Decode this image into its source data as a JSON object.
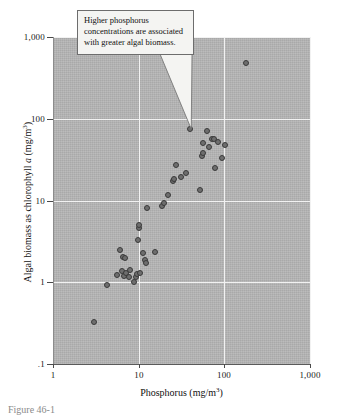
{
  "figure": {
    "caption_fragment": "Figure 46-1"
  },
  "callout": {
    "text": "Higher phosphorus concentrations are associated with greater algal biomass.",
    "target_point": {
      "x": 40,
      "y": 75
    }
  },
  "chart_data": {
    "type": "scatter",
    "title": "",
    "xlabel": "Phosphorus (mg/m",
    "xlabel_sup": "3",
    "xlabel_tail": ")",
    "ylabel_pre": "Algal biomass as chlorophyll ",
    "ylabel_ital": "a",
    "ylabel_mid": " (mg/m",
    "ylabel_sup": "3",
    "ylabel_tail": ")",
    "xscale": "log",
    "yscale": "log",
    "xlim": [
      1,
      1000
    ],
    "ylim": [
      0.1,
      1000
    ],
    "xticks": [
      1,
      10,
      100,
      1000
    ],
    "xtick_labels": [
      "1",
      "10",
      "100",
      "1,000"
    ],
    "yticks": [
      0.1,
      1,
      10,
      100,
      1000
    ],
    "ytick_labels": [
      ".1",
      "1",
      "10",
      "100",
      "1,000"
    ],
    "grid": true,
    "grid_color": "#f2f2f2",
    "plot_background": "#b5b5b5",
    "marker_fill": "#6e6e6e",
    "marker_edge": "#3a3a3a",
    "legend": "none",
    "points": [
      {
        "x": 3.0,
        "y": 0.33
      },
      {
        "x": 4.3,
        "y": 0.93
      },
      {
        "x": 5.6,
        "y": 1.22
      },
      {
        "x": 6.1,
        "y": 2.45
      },
      {
        "x": 6.3,
        "y": 1.38
      },
      {
        "x": 6.5,
        "y": 2.05
      },
      {
        "x": 6.8,
        "y": 1.18
      },
      {
        "x": 6.9,
        "y": 2.0
      },
      {
        "x": 7.2,
        "y": 1.3
      },
      {
        "x": 7.6,
        "y": 1.15
      },
      {
        "x": 8.0,
        "y": 1.42
      },
      {
        "x": 8.7,
        "y": 1.02
      },
      {
        "x": 9.2,
        "y": 1.15
      },
      {
        "x": 9.6,
        "y": 1.28
      },
      {
        "x": 9.7,
        "y": 3.3
      },
      {
        "x": 10.0,
        "y": 4.6
      },
      {
        "x": 10.1,
        "y": 5.0
      },
      {
        "x": 10.4,
        "y": 1.3
      },
      {
        "x": 11.3,
        "y": 2.3
      },
      {
        "x": 11.8,
        "y": 1.9
      },
      {
        "x": 12.2,
        "y": 1.7
      },
      {
        "x": 12.6,
        "y": 8.0
      },
      {
        "x": 15.5,
        "y": 2.35
      },
      {
        "x": 18.5,
        "y": 8.6
      },
      {
        "x": 19.5,
        "y": 9.3
      },
      {
        "x": 22.0,
        "y": 11.8
      },
      {
        "x": 25.0,
        "y": 17.5
      },
      {
        "x": 25.5,
        "y": 18.5
      },
      {
        "x": 27.5,
        "y": 27.0
      },
      {
        "x": 31.0,
        "y": 19.5
      },
      {
        "x": 36.0,
        "y": 21.5
      },
      {
        "x": 40.0,
        "y": 75.0
      },
      {
        "x": 52.0,
        "y": 13.5
      },
      {
        "x": 55.0,
        "y": 35.0
      },
      {
        "x": 56.0,
        "y": 38.0
      },
      {
        "x": 57.0,
        "y": 50.0
      },
      {
        "x": 62.0,
        "y": 70.0
      },
      {
        "x": 66.0,
        "y": 45.0
      },
      {
        "x": 72.0,
        "y": 57.0
      },
      {
        "x": 75.0,
        "y": 56.0
      },
      {
        "x": 78.0,
        "y": 25.0
      },
      {
        "x": 85.0,
        "y": 52.0
      },
      {
        "x": 95.0,
        "y": 33.0
      },
      {
        "x": 103.0,
        "y": 48.0
      },
      {
        "x": 180.0,
        "y": 480.0
      }
    ]
  }
}
